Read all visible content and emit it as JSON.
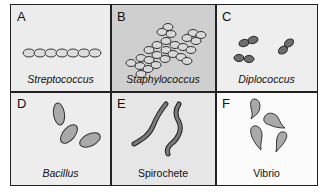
{
  "figure": {
    "panels": [
      {
        "letter": "A",
        "label": "Streptococcus",
        "italic": true,
        "bg": "#ececec",
        "shape": "chain of cocci"
      },
      {
        "letter": "B",
        "label": "Staphylococcus",
        "italic": true,
        "bg": "#cfcfcf",
        "shape": "grape-like cluster of cocci"
      },
      {
        "letter": "C",
        "label": "Diplococcus",
        "italic": true,
        "bg": "#eeeeee",
        "shape": "paired cocci"
      },
      {
        "letter": "D",
        "label": "Bacillus",
        "italic": true,
        "bg": "#ededed",
        "shape": "rod-shaped cells"
      },
      {
        "letter": "E",
        "label": "Spirochete",
        "italic": false,
        "bg": "#e6e6e6",
        "shape": "spiral cells"
      },
      {
        "letter": "F",
        "label": "Vibrio",
        "italic": false,
        "bg": "#fbfbfb",
        "shape": "comma-shaped cells"
      }
    ],
    "colors": {
      "border": "#222222",
      "cell_fill_light": "#d9d9d9",
      "cell_fill_dark": "#6e6e6e",
      "cell_fill_mid": "#a9a9a9"
    }
  }
}
